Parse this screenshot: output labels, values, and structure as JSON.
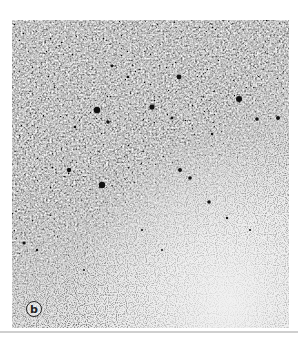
{
  "figure": {
    "panel_label": "b",
    "colors": {
      "dense_region": "#8a8a8a",
      "pale_region": "#ededed",
      "dark_dots": "#111111",
      "rule": "#cfcfcf"
    },
    "dark_dots": [
      {
        "x": 85,
        "y": 90,
        "r": 3.2
      },
      {
        "x": 140,
        "y": 87,
        "r": 2.6
      },
      {
        "x": 167,
        "y": 57,
        "r": 2.4
      },
      {
        "x": 227,
        "y": 79,
        "r": 3.0
      },
      {
        "x": 90,
        "y": 165,
        "r": 3.2
      },
      {
        "x": 96,
        "y": 102,
        "r": 1.8
      },
      {
        "x": 57,
        "y": 150,
        "r": 2.2
      },
      {
        "x": 168,
        "y": 150,
        "r": 2.0
      },
      {
        "x": 178,
        "y": 158,
        "r": 1.8
      },
      {
        "x": 245,
        "y": 99,
        "r": 1.8
      },
      {
        "x": 266,
        "y": 98,
        "r": 2.0
      },
      {
        "x": 197,
        "y": 182,
        "r": 1.8
      },
      {
        "x": 12,
        "y": 223,
        "r": 1.6
      },
      {
        "x": 100,
        "y": 46,
        "r": 1.4
      },
      {
        "x": 116,
        "y": 57,
        "r": 1.3
      },
      {
        "x": 63,
        "y": 107,
        "r": 1.3
      },
      {
        "x": 160,
        "y": 98,
        "r": 1.4
      },
      {
        "x": 200,
        "y": 114,
        "r": 1.3
      },
      {
        "x": 25,
        "y": 230,
        "r": 1.2
      },
      {
        "x": 215,
        "y": 198,
        "r": 1.2
      },
      {
        "x": 238,
        "y": 210,
        "r": 1.1
      },
      {
        "x": 130,
        "y": 210,
        "r": 1.1
      },
      {
        "x": 72,
        "y": 250,
        "r": 1.0
      },
      {
        "x": 150,
        "y": 230,
        "r": 1.0
      }
    ]
  }
}
